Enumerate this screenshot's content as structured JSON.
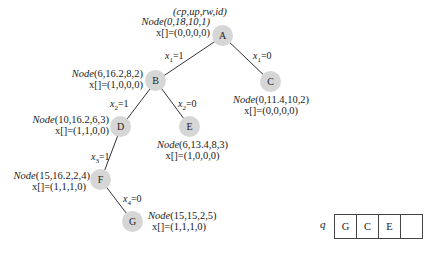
{
  "header_label": "(cp,up,rw,id)",
  "nodes": {
    "A": {
      "id": "A",
      "node": "Node(0,18,10,1)",
      "x": "x[]=(0,0,0,0)"
    },
    "B": {
      "id": "B",
      "node": "Node(6,16.2,8,2)",
      "x": "x[]=(1,0,0,0)"
    },
    "C": {
      "id": "C",
      "node": "Node(0,11.4,10,2)",
      "x": "x[]=(0,0,0,0)"
    },
    "D": {
      "id": "D",
      "node": "Node(10,16.2,6,3)",
      "x": "x[]=(1,1,0,0)"
    },
    "E": {
      "id": "E",
      "node": "Node(6,13.4,8,3)",
      "x": "x[]=(1,0,0,0)"
    },
    "F": {
      "id": "F",
      "node": "Node(15,16.2,2,4)",
      "x": "x[]=(1,1,1,0)"
    },
    "G": {
      "id": "G",
      "node": "Node(15,15,2,5)",
      "x": "x[]=(1,1,1,0)"
    }
  },
  "edges": {
    "AB": {
      "var": "x",
      "sub": "1",
      "val": "=1"
    },
    "AC": {
      "var": "x",
      "sub": "1",
      "val": "=0"
    },
    "BD": {
      "var": "x",
      "sub": "2",
      "val": "=1"
    },
    "BE": {
      "var": "x",
      "sub": "2",
      "val": "=0"
    },
    "DF": {
      "var": "x",
      "sub": "3",
      "val": "=1"
    },
    "FG": {
      "var": "x",
      "sub": "4",
      "val": "=0"
    }
  },
  "queue": {
    "label": "q",
    "cells": [
      "G",
      "C",
      "E",
      ""
    ]
  },
  "colors": {
    "node_fill": "#d6d6d6",
    "edge": "#333333"
  }
}
